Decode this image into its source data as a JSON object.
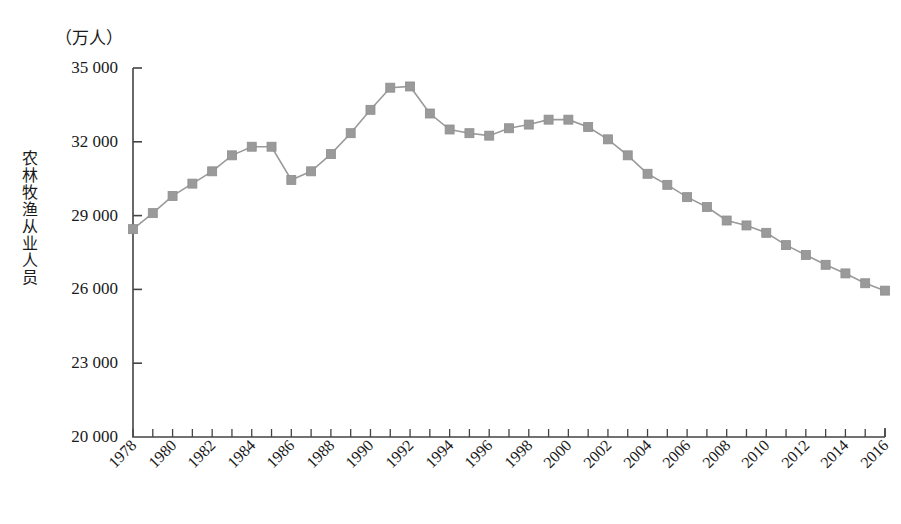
{
  "chart_data": {
    "type": "line",
    "title": "",
    "subtitle": "",
    "unit_label": "（万人）",
    "ylabel": "农林牧渔从业人员",
    "xlabel": "",
    "ylim": [
      20000,
      35000
    ],
    "ytick_values": [
      35000,
      32000,
      29000,
      26000,
      23000,
      20000
    ],
    "ytick_labels": [
      "35 000",
      "32 000",
      "29 000",
      "26 000",
      "23 000",
      "20 000"
    ],
    "grid": false,
    "legend": "none",
    "marker": "square",
    "series_color": "#9a9a9a",
    "axis_color": "#444444",
    "x": [
      1978,
      1979,
      1980,
      1981,
      1982,
      1983,
      1984,
      1985,
      1986,
      1987,
      1988,
      1989,
      1990,
      1991,
      1992,
      1993,
      1994,
      1995,
      1996,
      1997,
      1998,
      1999,
      2000,
      2001,
      2002,
      2003,
      2004,
      2005,
      2006,
      2007,
      2008,
      2009,
      2010,
      2011,
      2012,
      2013,
      2014,
      2015,
      2016
    ],
    "xtick_labels": [
      "1978",
      "1980",
      "1982",
      "1984",
      "1986",
      "1988",
      "1990",
      "1992",
      "1994",
      "1996",
      "1998",
      "2000",
      "2002",
      "2004",
      "2006",
      "2008",
      "2010",
      "2012",
      "2014",
      "2016"
    ],
    "xtick_values": [
      1978,
      1980,
      1982,
      1984,
      1986,
      1988,
      1990,
      1992,
      1994,
      1996,
      1998,
      2000,
      2002,
      2004,
      2006,
      2008,
      2010,
      2012,
      2014,
      2016
    ],
    "values": [
      28450,
      29100,
      29800,
      30300,
      30800,
      31450,
      31800,
      31800,
      30450,
      30800,
      31500,
      32350,
      33300,
      34200,
      34250,
      33150,
      32500,
      32350,
      32250,
      32550,
      32700,
      32900,
      32900,
      32600,
      32100,
      31450,
      30700,
      30250,
      29750,
      29350,
      28800,
      28600,
      28300,
      27800,
      27400,
      27000,
      26650,
      26250,
      25950
    ],
    "series": [
      {
        "name": "农林牧渔从业人员",
        "values": [
          28450,
          29100,
          29800,
          30300,
          30800,
          31450,
          31800,
          31800,
          30450,
          30800,
          31500,
          32350,
          33300,
          34200,
          34250,
          33150,
          32500,
          32350,
          32250,
          32550,
          32700,
          32900,
          32900,
          32600,
          32100,
          31450,
          30700,
          30250,
          29750,
          29350,
          28800,
          28600,
          28300,
          27800,
          27400,
          27000,
          26650,
          26250,
          25950
        ]
      }
    ]
  }
}
